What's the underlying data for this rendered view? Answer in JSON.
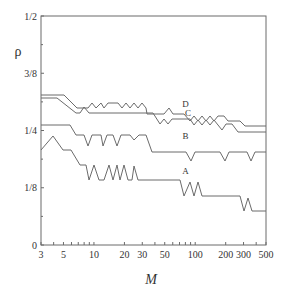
{
  "chart_data": {
    "type": "line",
    "title": "",
    "xlabel": "M",
    "ylabel": "ρ",
    "x_scale": "log",
    "xlim": [
      3,
      500
    ],
    "ylim": [
      0,
      0.5
    ],
    "grid": false,
    "legend": "inline curve labels",
    "x_ticks": [
      {
        "value": 3,
        "label": "3"
      },
      {
        "value": 5,
        "label": "5"
      },
      {
        "value": 10,
        "label": "10"
      },
      {
        "value": 20,
        "label": "20"
      },
      {
        "value": 30,
        "label": "30"
      },
      {
        "value": 50,
        "label": "50"
      },
      {
        "value": 100,
        "label": "100"
      },
      {
        "value": 200,
        "label": "200"
      },
      {
        "value": 300,
        "label": "300"
      },
      {
        "value": 500,
        "label": "500"
      }
    ],
    "x_minor_ticks": [
      4,
      6,
      7,
      8,
      9,
      40,
      60,
      70,
      80,
      90,
      400
    ],
    "y_ticks": [
      {
        "value": 0,
        "label": "0"
      },
      {
        "value": 0.125,
        "label": "1/8"
      },
      {
        "value": 0.25,
        "label": "1/4"
      },
      {
        "value": 0.375,
        "label": "3/8"
      },
      {
        "value": 0.5,
        "label": "1/2"
      }
    ],
    "y_minor_ticks": [
      0.0625,
      0.1875,
      0.3125,
      0.4375
    ],
    "series": [
      {
        "name": "D",
        "label_pos": {
          "M": 80,
          "rho": 0.302
        },
        "points_px": [
          [
            41,
            95
          ],
          [
            64,
            95
          ],
          [
            77,
            108
          ],
          [
            88,
            108
          ],
          [
            92,
            103
          ],
          [
            96,
            108
          ],
          [
            101,
            103
          ],
          [
            104,
            108
          ],
          [
            108,
            103
          ],
          [
            118,
            103
          ],
          [
            122,
            108
          ],
          [
            126,
            103
          ],
          [
            130,
            108
          ],
          [
            134,
            103
          ],
          [
            138,
            108
          ],
          [
            142,
            103
          ],
          [
            146,
            108
          ],
          [
            147,
            114
          ],
          [
            164,
            114
          ],
          [
            169,
            108
          ],
          [
            173,
            114
          ],
          [
            184,
            114
          ],
          [
            190,
            121
          ],
          [
            194,
            116
          ],
          [
            198,
            121
          ],
          [
            202,
            116
          ],
          [
            206,
            121
          ],
          [
            210,
            116
          ],
          [
            214,
            121
          ],
          [
            218,
            116
          ],
          [
            224,
            116
          ],
          [
            228,
            121
          ],
          [
            240,
            121
          ],
          [
            245,
            126
          ],
          [
            266,
            126
          ]
        ],
        "approx_values": [
          [
            3,
            0.326
          ],
          [
            5,
            0.326
          ],
          [
            10,
            0.299
          ],
          [
            30,
            0.286
          ],
          [
            100,
            0.271
          ],
          [
            500,
            0.259
          ]
        ]
      },
      {
        "name": "C",
        "label_pos": {
          "M": 85,
          "rho": 0.282
        },
        "points_px": [
          [
            41,
            98
          ],
          [
            57,
            98
          ],
          [
            76,
            113
          ],
          [
            80,
            113
          ],
          [
            84,
            107
          ],
          [
            89,
            113
          ],
          [
            153,
            113
          ],
          [
            160,
            124
          ],
          [
            164,
            119
          ],
          [
            168,
            124
          ],
          [
            172,
            119
          ],
          [
            190,
            119
          ],
          [
            194,
            125
          ],
          [
            198,
            120
          ],
          [
            202,
            125
          ],
          [
            206,
            120
          ],
          [
            210,
            125
          ],
          [
            214,
            120
          ],
          [
            218,
            125
          ],
          [
            222,
            130
          ],
          [
            226,
            124
          ],
          [
            232,
            124
          ],
          [
            238,
            132
          ],
          [
            266,
            132
          ]
        ],
        "approx_values": [
          [
            3,
            0.32
          ],
          [
            5,
            0.32
          ],
          [
            10,
            0.288
          ],
          [
            70,
            0.266
          ],
          [
            150,
            0.255
          ],
          [
            500,
            0.246
          ]
        ]
      },
      {
        "name": "B",
        "label_pos": {
          "M": 80,
          "rho": 0.232
        },
        "points_px": [
          [
            41,
            125
          ],
          [
            70,
            125
          ],
          [
            76,
            135
          ],
          [
            84,
            135
          ],
          [
            88,
            146
          ],
          [
            92,
            135
          ],
          [
            101,
            135
          ],
          [
            103,
            146
          ],
          [
            107,
            135
          ],
          [
            113,
            135
          ],
          [
            117,
            146
          ],
          [
            121,
            135
          ],
          [
            130,
            135
          ],
          [
            134,
            140
          ],
          [
            139,
            135
          ],
          [
            146,
            135
          ],
          [
            152,
            152
          ],
          [
            186,
            152
          ],
          [
            191,
            161
          ],
          [
            195,
            152
          ],
          [
            220,
            152
          ],
          [
            225,
            161
          ],
          [
            229,
            152
          ],
          [
            247,
            152
          ],
          [
            251,
            161
          ],
          [
            255,
            152
          ],
          [
            266,
            152
          ]
        ],
        "approx_values": [
          [
            3,
            0.262
          ],
          [
            5,
            0.262
          ],
          [
            10,
            0.24
          ],
          [
            50,
            0.202
          ],
          [
            500,
            0.202
          ]
        ]
      },
      {
        "name": "A",
        "label_pos": {
          "M": 80,
          "rho": 0.155
        },
        "points_px": [
          [
            41,
            150
          ],
          [
            53,
            136
          ],
          [
            63,
            150
          ],
          [
            71,
            150
          ],
          [
            80,
            165
          ],
          [
            86,
            165
          ],
          [
            89,
            180
          ],
          [
            94,
            165
          ],
          [
            99,
            180
          ],
          [
            104,
            180
          ],
          [
            109,
            165
          ],
          [
            113,
            180
          ],
          [
            117,
            165
          ],
          [
            120,
            180
          ],
          [
            124,
            165
          ],
          [
            128,
            180
          ],
          [
            132,
            180
          ],
          [
            134,
            166
          ],
          [
            138,
            180
          ],
          [
            176,
            180
          ],
          [
            180,
            180
          ],
          [
            184,
            196
          ],
          [
            190,
            182
          ],
          [
            194,
            196
          ],
          [
            198,
            182
          ],
          [
            202,
            196
          ],
          [
            210,
            196
          ],
          [
            214,
            196
          ],
          [
            240,
            196
          ],
          [
            244,
            211
          ],
          [
            248,
            198
          ],
          [
            252,
            211
          ],
          [
            266,
            211
          ]
        ],
        "approx_values": [
          [
            3,
            0.207
          ],
          [
            5,
            0.237
          ],
          [
            10,
            0.162
          ],
          [
            30,
            0.142
          ],
          [
            100,
            0.107
          ],
          [
            500,
            0.074
          ]
        ]
      }
    ]
  }
}
